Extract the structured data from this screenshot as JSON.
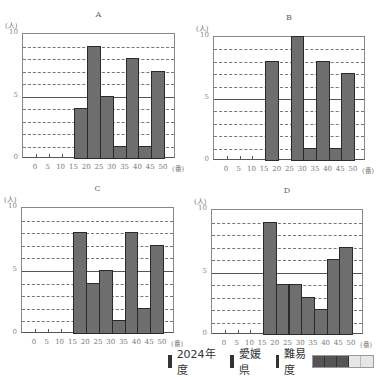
{
  "chart_data": [
    {
      "type": "bar",
      "title": "A",
      "xlabel": "(番)",
      "ylabel": "(人)",
      "ylim": [
        0,
        10
      ],
      "yticks": [
        0,
        5,
        10
      ],
      "xticks": [
        0,
        5,
        10,
        15,
        20,
        25,
        30,
        35,
        40,
        45,
        50
      ],
      "categories": [
        "15-20",
        "20-25",
        "25-30",
        "30-35",
        "35-40",
        "40-45",
        "45-50"
      ],
      "values": [
        4,
        9,
        5,
        1,
        8,
        1,
        7
      ],
      "grid": "dashed at every 1, solid at 5"
    },
    {
      "type": "bar",
      "title": "B",
      "xlabel": "(番)",
      "ylabel": "(人)",
      "ylim": [
        0,
        10
      ],
      "yticks": [
        0,
        5,
        10
      ],
      "xticks": [
        0,
        5,
        10,
        15,
        20,
        25,
        30,
        35,
        40,
        45,
        50
      ],
      "categories": [
        "15-20",
        "20-25",
        "25-30",
        "30-35",
        "35-40",
        "40-45",
        "45-50"
      ],
      "values": [
        8,
        0,
        10,
        1,
        8,
        1,
        7
      ],
      "grid": "dashed at every 1, solid at 5"
    },
    {
      "type": "bar",
      "title": "C",
      "xlabel": "(番)",
      "ylabel": "(人)",
      "ylim": [
        0,
        10
      ],
      "yticks": [
        0,
        5,
        10
      ],
      "xticks": [
        0,
        5,
        10,
        15,
        20,
        25,
        30,
        35,
        40,
        45,
        50
      ],
      "categories": [
        "15-20",
        "20-25",
        "25-30",
        "30-35",
        "35-40",
        "40-45",
        "45-50"
      ],
      "values": [
        8,
        4,
        5,
        1,
        8,
        2,
        7
      ],
      "grid": "dashed at every 1, solid at 5"
    },
    {
      "type": "bar",
      "title": "D",
      "xlabel": "(番)",
      "ylabel": "(人)",
      "ylim": [
        0,
        10
      ],
      "yticks": [
        0,
        5,
        10
      ],
      "xticks": [
        0,
        5,
        10,
        15,
        20,
        25,
        30,
        35,
        40,
        45,
        50
      ],
      "categories": [
        "15-20",
        "20-25",
        "25-30",
        "30-35",
        "35-40",
        "40-45",
        "45-50"
      ],
      "values": [
        9,
        4,
        4,
        3,
        2,
        6,
        7
      ],
      "grid": "dashed at every 1, solid at 5"
    }
  ],
  "charts": [
    {
      "title": "A",
      "unit_y": "(人)",
      "unit_x": "(番)",
      "y_labels": [
        "10",
        "5",
        "0"
      ],
      "frame": {
        "left": 22,
        "top": 33,
        "right": 175,
        "bottom": 158
      }
    },
    {
      "title": "B",
      "unit_y": "(人)",
      "unit_x": "(番)",
      "y_labels": [
        "10",
        "5",
        "0"
      ],
      "frame": {
        "left": 213,
        "top": 36,
        "right": 365,
        "bottom": 160
      }
    },
    {
      "title": "C",
      "unit_y": "(人)",
      "unit_x": "(番)",
      "y_labels": [
        "10",
        "5",
        "0"
      ],
      "frame": {
        "left": 21,
        "top": 207,
        "right": 174,
        "bottom": 333
      }
    },
    {
      "title": "D",
      "unit_y": "(人)",
      "unit_x": "(番)",
      "y_labels": [
        "10",
        "5",
        "0"
      ],
      "frame": {
        "left": 211,
        "top": 209,
        "right": 363,
        "bottom": 334
      }
    }
  ],
  "x_labels": [
    "0",
    "5",
    "10",
    "15",
    "20",
    "25",
    "30",
    "35",
    "40",
    "45",
    "50"
  ],
  "footer": {
    "year": "2024年度",
    "prefecture": "愛媛県",
    "difficulty_label": "難易度",
    "difficulty_level": 3,
    "difficulty_max": 5
  },
  "colors": {
    "bar_fill": "#6e6e6e",
    "bar_border": "#2a2a2a",
    "meter_on": "#555555",
    "meter_off": "#e6e6e6"
  }
}
